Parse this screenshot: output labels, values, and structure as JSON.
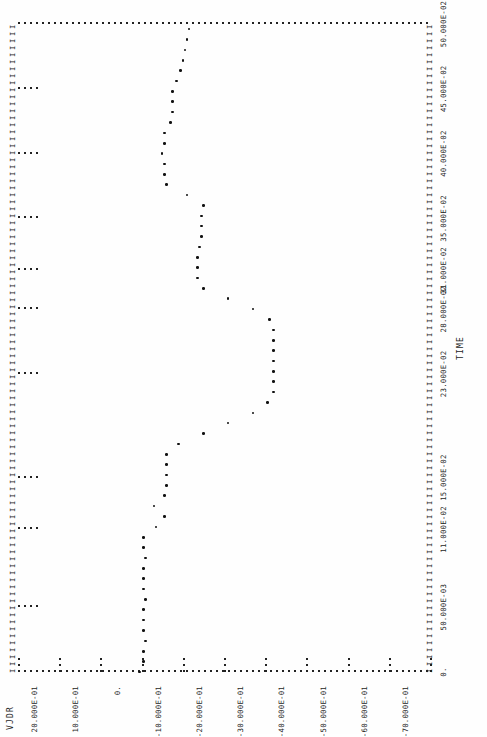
{
  "chart_data": {
    "type": "scatter",
    "title": "",
    "subtitle": "",
    "xlabel": "TIME",
    "ylabel": "VJDR",
    "style": "line-printer character plot",
    "grid": false,
    "legend": null,
    "orientation": "page rotated 90 degrees (landscape printout)",
    "x_axis": {
      "label": "TIME",
      "tick_labels": [
        "0.",
        "50.000E-03",
        "11.000E-02",
        "15.000E-02",
        "23.000E-02",
        "28.000E-02",
        "31.000E-02",
        "35.000E-02",
        "40.000E-02",
        "45.000E-02",
        "50.000E-02"
      ],
      "tick_values": [
        0,
        0.05,
        0.11,
        0.15,
        0.23,
        0.28,
        0.31,
        0.35,
        0.4,
        0.45,
        0.5
      ],
      "range": [
        0,
        0.5
      ],
      "units": "seconds"
    },
    "y_axis": {
      "label": "VJDR",
      "tick_labels": [
        "30.000E-01",
        "20.000E-01",
        "10.000E-01",
        "0.",
        "-10.000E-01",
        "-20.000E-01",
        "-30.000E-01",
        "-40.000E-01",
        "-50.000E-01",
        "-60.000E-01",
        "-70.000E-01"
      ],
      "tick_values": [
        3,
        2,
        1,
        0,
        -1,
        -2,
        -3,
        -4,
        -5,
        -6,
        -7
      ],
      "range": [
        3,
        -7
      ],
      "units": "volts"
    },
    "x": [
      0.0,
      0.008,
      0.016,
      0.024,
      0.032,
      0.04,
      0.048,
      0.056,
      0.064,
      0.072,
      0.08,
      0.088,
      0.096,
      0.104,
      0.112,
      0.12,
      0.128,
      0.136,
      0.144,
      0.152,
      0.16,
      0.168,
      0.176,
      0.184,
      0.192,
      0.2,
      0.208,
      0.216,
      0.224,
      0.232,
      0.24,
      0.248,
      0.256,
      0.264,
      0.272,
      0.28,
      0.288,
      0.296,
      0.304,
      0.312,
      0.32,
      0.328,
      0.336,
      0.344,
      0.352,
      0.36,
      0.368,
      0.376,
      0.384,
      0.392,
      0.4,
      0.408,
      0.416,
      0.424,
      0.432,
      0.44,
      0.448,
      0.456,
      0.464,
      0.472,
      0.48,
      0.488,
      0.496
    ],
    "y": [
      0.05,
      -0.05,
      -0.05,
      -0.1,
      -0.05,
      -0.05,
      -0.05,
      -0.1,
      -0.05,
      -0.05,
      -0.05,
      -0.1,
      -0.05,
      -0.05,
      -0.35,
      -0.55,
      -0.3,
      -0.55,
      -0.6,
      -0.6,
      -0.6,
      -0.6,
      -0.9,
      -1.5,
      -2.1,
      -2.7,
      -3.05,
      -3.2,
      -3.2,
      -3.2,
      -3.2,
      -3.2,
      -3.2,
      -3.2,
      -3.1,
      -2.7,
      -2.1,
      -1.5,
      -1.35,
      -1.35,
      -1.35,
      -1.4,
      -1.45,
      -1.45,
      -1.45,
      -1.5,
      -1.1,
      -0.6,
      -0.55,
      -0.55,
      -0.5,
      -0.55,
      -0.55,
      -0.7,
      -0.75,
      -0.75,
      -0.75,
      -0.85,
      -0.95,
      -1.0,
      -1.05,
      -1.1,
      -1.15
    ]
  },
  "plot": {
    "y_axis_title": "VJDR",
    "x_axis_title": "TIME",
    "origin_label": "0.",
    "y_tick_labels": [
      "30.000E-01",
      "20.000E-01",
      "10.000E-01",
      "0.",
      "-10.000E-01",
      "-20.000E-01",
      "-30.000E-01",
      "-40.000E-01",
      "-50.000E-01",
      "-60.000E-01",
      "-70.000E-01"
    ],
    "x_tick_labels": [
      "0.",
      "50.000E-03",
      "11.000E-02",
      "15.000E-02",
      "23.000E-02",
      "28.000E-02",
      "31.000E-02",
      "35.000E-02",
      "40.000E-02",
      "45.000E-02",
      "50.000E-02"
    ],
    "tick_glyph": "I",
    "mark_glyph": "*",
    "ink_color": "#1a1a1a",
    "paper_color": "#ffffff"
  }
}
